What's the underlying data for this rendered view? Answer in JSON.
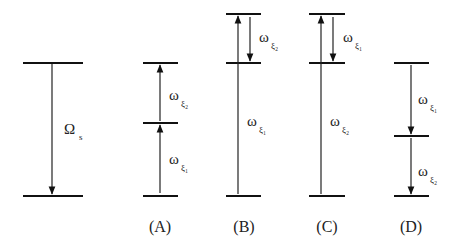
{
  "diagram": {
    "type": "energy-level-transitions",
    "panels": [
      {
        "id": "S",
        "caption": "",
        "label_main": "Ω",
        "label_sub": "s",
        "transition": "single downward transition Ω_s"
      },
      {
        "id": "A",
        "caption": "(A)",
        "labels": [
          {
            "main": "ω",
            "sub": "ξ₂",
            "position": "upper"
          },
          {
            "main": "ω",
            "sub": "ξ₁",
            "position": "lower"
          }
        ],
        "transitions": "two sequential upward transitions ω_ξ1 then ω_ξ2"
      },
      {
        "id": "B",
        "caption": "(B)",
        "labels": [
          {
            "main": "ω",
            "sub": "ξ₂",
            "position": "upper"
          },
          {
            "main": "ω",
            "sub": "ξ₁",
            "position": "lower"
          }
        ],
        "transitions": "upward ω_ξ1 to top level, downward ω_ξ2 to middle level"
      },
      {
        "id": "C",
        "caption": "(C)",
        "labels": [
          {
            "main": "ω",
            "sub": "ξ₁",
            "position": "upper"
          },
          {
            "main": "ω",
            "sub": "ξ₂",
            "position": "lower"
          }
        ],
        "transitions": "upward ω_ξ2 to top level, downward ω_ξ1 to middle level"
      },
      {
        "id": "D",
        "caption": "(D)",
        "labels": [
          {
            "main": "ω",
            "sub": "ξ₁",
            "position": "upper"
          },
          {
            "main": "ω",
            "sub": "ξ₂",
            "position": "lower"
          }
        ],
        "transitions": "two sequential downward transitions ω_ξ1 then ω_ξ2"
      }
    ]
  },
  "text": {
    "omega_s_main": "Ω",
    "omega_s_sub": "s",
    "w": "ω",
    "xi1": "ξ₁",
    "xi2": "ξ₂",
    "cap_a": "(A)",
    "cap_b": "(B)",
    "cap_c": "(C)",
    "cap_d": "(D)"
  }
}
